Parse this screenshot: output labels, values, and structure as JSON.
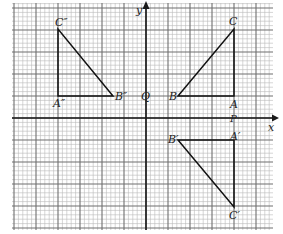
{
  "diagram": {
    "type": "coordinate-grid-reflections",
    "grid": {
      "left": 12,
      "top": 3,
      "right": 273,
      "bottom": 230,
      "minor_step": 4.4,
      "major_every": 5,
      "minor_color": "#b9b9b9",
      "major_color": "#6f6f6f",
      "axis_color": "#1a1a1a"
    },
    "axes": {
      "origin_px": [
        146,
        118
      ],
      "x_label": "x",
      "y_label": "y"
    },
    "points": {
      "Q": {
        "label": "Q",
        "px": [
          146,
          96
        ]
      },
      "P": {
        "label": "P",
        "px": [
          234,
          118
        ]
      }
    },
    "triangles": [
      {
        "name": "ABC",
        "vertices": [
          {
            "label": "A",
            "px": [
              234,
              96
            ]
          },
          {
            "label": "B",
            "px": [
              178,
              96
            ]
          },
          {
            "label": "C",
            "px": [
              234,
              29
            ]
          }
        ],
        "stroke": "#111111"
      },
      {
        "name": "A''B''C''",
        "vertices": [
          {
            "label": "A''",
            "px": [
              58,
              96
            ]
          },
          {
            "label": "B''",
            "px": [
              113,
              96
            ]
          },
          {
            "label": "C''",
            "px": [
              58,
              29
            ]
          }
        ],
        "stroke": "#111111"
      },
      {
        "name": "A'B'C'",
        "vertices": [
          {
            "label": "A'",
            "px": [
              234,
              140
            ]
          },
          {
            "label": "B'",
            "px": [
              178,
              140
            ]
          },
          {
            "label": "C'",
            "px": [
              234,
              207
            ]
          }
        ],
        "stroke": "#111111"
      }
    ],
    "labels": {
      "y": "y",
      "x": "x",
      "Q": "Q",
      "P": "P",
      "A": "A",
      "B": "B",
      "C": "C",
      "A1": "A′",
      "B1": "B′",
      "C1": "C′",
      "A2": "A″",
      "B2": "B″",
      "C2": "C″"
    }
  }
}
